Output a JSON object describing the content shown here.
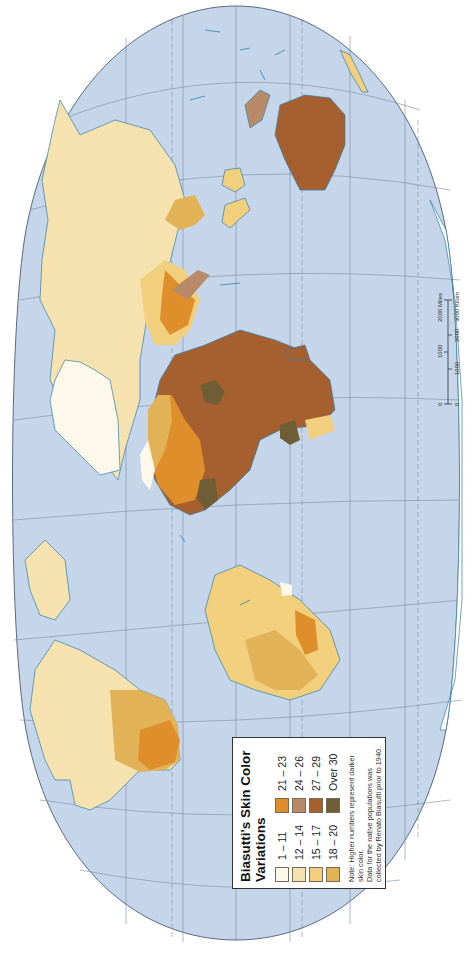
{
  "map": {
    "title": "Biasutti's Skin Color Variations",
    "orientation": "rotated 90° counter-clockwise (north points left)",
    "ocean_color": "#c5d6ea",
    "coast_color": "#2f7fa8"
  },
  "legend": {
    "title_line1": "Biasutti's Skin Color",
    "title_line2": "Variations",
    "classes": [
      {
        "label": "1 – 11",
        "color": "#fdf8ea"
      },
      {
        "label": "12 – 14",
        "color": "#f6e2ae"
      },
      {
        "label": "15 – 17",
        "color": "#f2cf7c"
      },
      {
        "label": "18 – 20",
        "color": "#e2b257"
      },
      {
        "label": "21 – 23",
        "color": "#de8f2c"
      },
      {
        "label": "24 – 26",
        "color": "#b98a67"
      },
      {
        "label": "27 – 29",
        "color": "#a6602f"
      },
      {
        "label": "Over 30",
        "color": "#6f5e35"
      }
    ],
    "note_line1": "Note: Higher numbers represent darker skin color.",
    "note_line2": "Data for the native populations was collected by Renato Biasutti prior to 1940."
  },
  "scale_bar": {
    "miles_ticks": [
      "0",
      "1000",
      "2000 Miles"
    ],
    "km_ticks": [
      "0",
      "1000",
      "2000",
      "3000 Kilometers"
    ]
  }
}
